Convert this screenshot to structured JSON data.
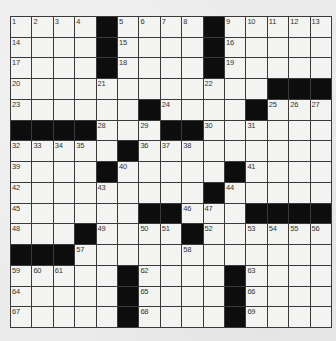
{
  "puzzle": {
    "rows": 15,
    "cols": 15,
    "layout": [
      "....#....#.....",
      "....#....#.....",
      "....#....#.....",
      "............###",
      "......#....#...",
      "####...##......",
      ".....#.........",
      "....#.....#....",
      ".........#.....",
      "......##...####",
      "...#....#......",
      "###............",
      ".....#....#....",
      ".....#....#....",
      ".....#....#...."
    ],
    "numbers": [
      {
        "r": 0,
        "c": 0,
        "n": "1"
      },
      {
        "r": 0,
        "c": 1,
        "n": "2"
      },
      {
        "r": 0,
        "c": 2,
        "n": "3"
      },
      {
        "r": 0,
        "c": 3,
        "n": "4"
      },
      {
        "r": 0,
        "c": 5,
        "n": "5"
      },
      {
        "r": 0,
        "c": 6,
        "n": "6"
      },
      {
        "r": 0,
        "c": 7,
        "n": "7"
      },
      {
        "r": 0,
        "c": 8,
        "n": "8"
      },
      {
        "r": 0,
        "c": 10,
        "n": "9"
      },
      {
        "r": 0,
        "c": 11,
        "n": "10"
      },
      {
        "r": 0,
        "c": 12,
        "n": "11"
      },
      {
        "r": 0,
        "c": 13,
        "n": "12"
      },
      {
        "r": 0,
        "c": 14,
        "n": "13"
      },
      {
        "r": 1,
        "c": 0,
        "n": "14"
      },
      {
        "r": 1,
        "c": 5,
        "n": "15"
      },
      {
        "r": 1,
        "c": 10,
        "n": "16"
      },
      {
        "r": 2,
        "c": 0,
        "n": "17"
      },
      {
        "r": 2,
        "c": 5,
        "n": "18"
      },
      {
        "r": 2,
        "c": 10,
        "n": "19"
      },
      {
        "r": 3,
        "c": 0,
        "n": "20"
      },
      {
        "r": 3,
        "c": 4,
        "n": "21"
      },
      {
        "r": 3,
        "c": 9,
        "n": "22"
      },
      {
        "r": 4,
        "c": 0,
        "n": "23"
      },
      {
        "r": 4,
        "c": 7,
        "n": "24"
      },
      {
        "r": 4,
        "c": 12,
        "n": "25"
      },
      {
        "r": 4,
        "c": 13,
        "n": "26"
      },
      {
        "r": 4,
        "c": 14,
        "n": "27"
      },
      {
        "r": 5,
        "c": 4,
        "n": "28"
      },
      {
        "r": 5,
        "c": 6,
        "n": "29"
      },
      {
        "r": 5,
        "c": 9,
        "n": "30"
      },
      {
        "r": 5,
        "c": 11,
        "n": "31"
      },
      {
        "r": 6,
        "c": 0,
        "n": "32"
      },
      {
        "r": 6,
        "c": 1,
        "n": "33"
      },
      {
        "r": 6,
        "c": 2,
        "n": "34"
      },
      {
        "r": 6,
        "c": 3,
        "n": "35"
      },
      {
        "r": 6,
        "c": 6,
        "n": "36"
      },
      {
        "r": 6,
        "c": 7,
        "n": "37"
      },
      {
        "r": 6,
        "c": 8,
        "n": "38"
      },
      {
        "r": 7,
        "c": 0,
        "n": "39"
      },
      {
        "r": 7,
        "c": 5,
        "n": "40"
      },
      {
        "r": 7,
        "c": 11,
        "n": "41"
      },
      {
        "r": 8,
        "c": 0,
        "n": "42"
      },
      {
        "r": 8,
        "c": 4,
        "n": "43"
      },
      {
        "r": 8,
        "c": 10,
        "n": "44"
      },
      {
        "r": 9,
        "c": 0,
        "n": "45"
      },
      {
        "r": 9,
        "c": 8,
        "n": "46"
      },
      {
        "r": 9,
        "c": 9,
        "n": "47"
      },
      {
        "r": 10,
        "c": 0,
        "n": "48"
      },
      {
        "r": 10,
        "c": 4,
        "n": "49"
      },
      {
        "r": 10,
        "c": 6,
        "n": "50"
      },
      {
        "r": 10,
        "c": 7,
        "n": "51"
      },
      {
        "r": 10,
        "c": 9,
        "n": "52"
      },
      {
        "r": 10,
        "c": 11,
        "n": "53"
      },
      {
        "r": 10,
        "c": 12,
        "n": "54"
      },
      {
        "r": 10,
        "c": 13,
        "n": "55"
      },
      {
        "r": 10,
        "c": 14,
        "n": "56"
      },
      {
        "r": 11,
        "c": 3,
        "n": "57"
      },
      {
        "r": 11,
        "c": 8,
        "n": "58"
      },
      {
        "r": 12,
        "c": 0,
        "n": "59"
      },
      {
        "r": 12,
        "c": 1,
        "n": "60"
      },
      {
        "r": 12,
        "c": 2,
        "n": "61"
      },
      {
        "r": 12,
        "c": 6,
        "n": "62"
      },
      {
        "r": 12,
        "c": 11,
        "n": "63"
      },
      {
        "r": 13,
        "c": 0,
        "n": "64"
      },
      {
        "r": 13,
        "c": 6,
        "n": "65"
      },
      {
        "r": 13,
        "c": 11,
        "n": "66"
      },
      {
        "r": 14,
        "c": 0,
        "n": "67"
      },
      {
        "r": 14,
        "c": 6,
        "n": "68"
      },
      {
        "r": 14,
        "c": 11,
        "n": "69"
      }
    ],
    "letters": []
  },
  "colors": {
    "block": "#0d0d0d",
    "cell": "#f3f3f1",
    "gridline": "#3a3a3a",
    "paper": "#ebebeb"
  }
}
